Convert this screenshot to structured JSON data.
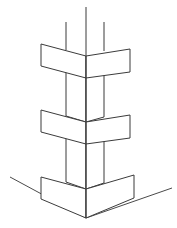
{
  "figure": {
    "title": "Column corner axonometric line drawing",
    "type": "line-drawing",
    "width": 177,
    "height": 228,
    "background_color": "#ffffff",
    "line_color": "#3b3b3b",
    "ground_line_color": "#4a4a4a",
    "fill_color": "#ffffff",
    "stroke_width": 1,
    "parts": [
      {
        "name": "shaft-top-edges",
        "label": "Column shaft upper edges",
        "count": 3
      },
      {
        "name": "band-upper",
        "label": "Upper projecting band"
      },
      {
        "name": "shaft-upper-middle",
        "label": "Shaft between upper and middle bands"
      },
      {
        "name": "band-middle",
        "label": "Middle projecting band"
      },
      {
        "name": "shaft-middle-base",
        "label": "Shaft between middle band and base"
      },
      {
        "name": "band-base",
        "label": "Base plinth band"
      },
      {
        "name": "ground-line-left",
        "label": "Left ground line"
      },
      {
        "name": "ground-line-right",
        "label": "Right ground line"
      }
    ],
    "geometry": {
      "center_x": 86,
      "shaft_left_x": 66,
      "shaft_right_x": 104,
      "shaft_top_center_y": 7,
      "shaft_top_side_y": 22,
      "band_left_x": 41,
      "band_right_x": 130,
      "band_upper": {
        "outer_top_y": 44,
        "center_top_y": 56,
        "outer_bottom_y": 66,
        "center_bottom_y": 78
      },
      "band_middle": {
        "outer_top_y": 110,
        "center_top_y": 122,
        "outer_bottom_y": 132,
        "center_bottom_y": 144
      },
      "band_base": {
        "outer_top_y": 177,
        "center_top_y": 189,
        "outer_bottom_y": 199,
        "center_bottom_y": 218
      },
      "ground_left_start": {
        "x": 10,
        "y": 177
      },
      "ground_right_end": {
        "x": 172,
        "y": 188
      }
    }
  }
}
